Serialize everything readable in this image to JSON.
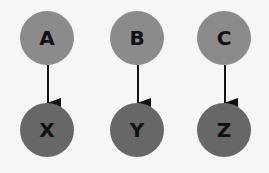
{
  "diagram": {
    "type": "directed-graph",
    "background": "#f6f6f6",
    "colors": {
      "source_node_fill": "#8b8b8b",
      "target_node_fill": "#676767",
      "label": "#111111",
      "edge": "#111111"
    },
    "nodes": [
      {
        "id": "A",
        "label": "A",
        "role": "source",
        "cx": 47,
        "cy": 38,
        "r": 27
      },
      {
        "id": "B",
        "label": "B",
        "role": "source",
        "cx": 137,
        "cy": 38,
        "r": 27
      },
      {
        "id": "C",
        "label": "C",
        "role": "source",
        "cx": 224,
        "cy": 38,
        "r": 27
      },
      {
        "id": "X",
        "label": "X",
        "role": "target",
        "cx": 47,
        "cy": 130,
        "r": 27
      },
      {
        "id": "Y",
        "label": "Y",
        "role": "target",
        "cx": 137,
        "cy": 130,
        "r": 27
      },
      {
        "id": "Z",
        "label": "Z",
        "role": "target",
        "cx": 224,
        "cy": 130,
        "r": 27
      }
    ],
    "edges": [
      {
        "from": "A",
        "to": "X"
      },
      {
        "from": "B",
        "to": "Y"
      },
      {
        "from": "C",
        "to": "Z"
      }
    ]
  }
}
